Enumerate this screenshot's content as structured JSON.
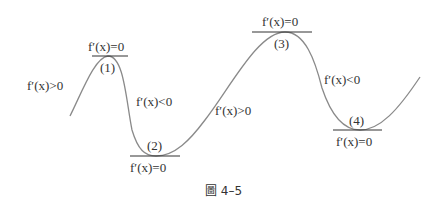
{
  "figure": {
    "caption": "圖 4–5",
    "curve_color": "#888888",
    "tangent_color": "#333333",
    "text_color": "#333333"
  },
  "points": [
    {
      "id": "1",
      "label": "(1)",
      "condition": "f′(x)=0"
    },
    {
      "id": "2",
      "label": "(2)",
      "condition": "f′(x)=0"
    },
    {
      "id": "3",
      "label": "(3)",
      "condition": "f′(x)=0"
    },
    {
      "id": "4",
      "label": "(4)",
      "condition": "f′(x)=0"
    }
  ],
  "segments": [
    {
      "position": "left-rising",
      "condition": "f′(x)>0"
    },
    {
      "position": "falling-after-1",
      "condition": "f′(x)<0"
    },
    {
      "position": "rising-after-2",
      "condition": "f′(x)>0"
    },
    {
      "position": "falling-after-3",
      "condition": "f′(x)<0"
    }
  ]
}
